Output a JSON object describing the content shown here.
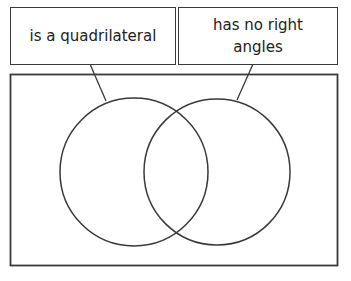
{
  "diagram": {
    "type": "venn",
    "sets": [
      {
        "id": "left",
        "label": "is a quadrilateral"
      },
      {
        "id": "right",
        "label": "has no right angles"
      }
    ],
    "label_lines": {
      "left": [
        "is a quadrilateral"
      ],
      "right": [
        "has no right",
        "angles"
      ]
    },
    "regions_contents": {
      "left_only": [],
      "both": [],
      "right_only": [],
      "outside": []
    },
    "colors": {
      "stroke": "#3a3a3a",
      "background": "#ffffff"
    }
  }
}
